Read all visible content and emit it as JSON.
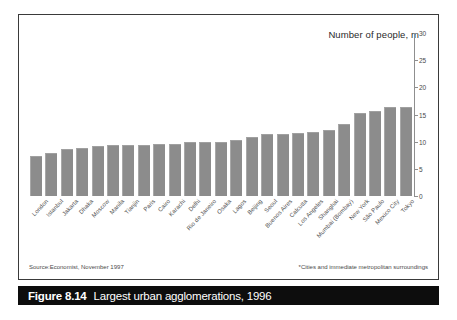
{
  "figure": {
    "caption_number": "Figure 8.14",
    "caption_text": "Largest urban agglomerations, 1996",
    "source_note": "Source:Economist, November 1997",
    "star_note": "*Cities and immediate metropolitan surroundings",
    "border_color": "#3a3a3a",
    "caption_bg": "#0d0d0d",
    "caption_fg": "#ffffff"
  },
  "chart_data": {
    "type": "bar",
    "title": "Number of people, m",
    "xlabel": "",
    "ylabel": "",
    "ylim": [
      0,
      30
    ],
    "yticks": [
      0,
      5,
      10,
      15,
      20,
      25,
      30
    ],
    "ytick_labels": [
      "0",
      "5",
      "10",
      "15",
      "20",
      "25",
      "30"
    ],
    "grid": false,
    "legend": "none",
    "bar_color": "#8c8c8c",
    "axis_color": "#8f8f8f",
    "orientation": "vertical",
    "categories": [
      "London",
      "Istanbul",
      "Jakarta",
      "Dhaka",
      "Moscow",
      "Manila",
      "Tianjin",
      "Paris",
      "Cairo",
      "Karachi",
      "Delhi",
      "Rio de Janeiro",
      "Osaka",
      "Lagos",
      "Beijing",
      "Seoul",
      "Buenos Aires",
      "Calcutta",
      "Los Angeles",
      "Shanghai",
      "Mumbai (Bombay)",
      "New York",
      "São Paulo",
      "Mexico City",
      "Tokyo"
    ],
    "values": [
      7.4,
      8.0,
      8.6,
      8.8,
      9.2,
      9.3,
      9.3,
      9.3,
      9.5,
      9.6,
      10.0,
      10.0,
      10.0,
      10.4,
      10.9,
      11.4,
      11.5,
      11.6,
      11.7,
      12.1,
      13.3,
      15.2,
      15.7,
      16.3,
      16.4
    ],
    "values_sorted_note": "ascending"
  }
}
